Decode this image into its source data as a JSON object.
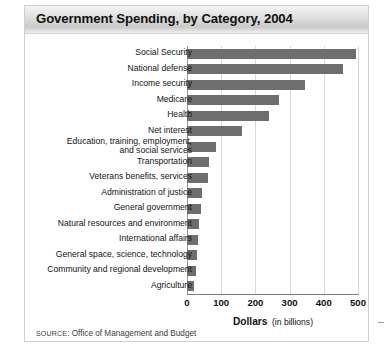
{
  "figure": {
    "title": "Government Spending, by Category, 2004",
    "source_prefix": "SOURCE",
    "source_rest": ": Office of Management and Budget",
    "axis_title_strong": "Dollars",
    "axis_title_sub": "(in billions)",
    "bar_color": "#6e6e6e",
    "grid_color": "#d9d9d9",
    "axis_color": "#7d7d7d",
    "title_band_color": "#dedede"
  },
  "chart_data": {
    "type": "bar",
    "orientation": "horizontal",
    "title": "Government Spending, by Category, 2004",
    "xlabel": "Dollars (in billions)",
    "ylabel": "",
    "xlim": [
      0,
      500
    ],
    "xticks": [
      0,
      100,
      200,
      300,
      400,
      500
    ],
    "grid": true,
    "legend": false,
    "source": "SOURCE: Office of Management and Budget",
    "categories": [
      "Social Security",
      "National defense",
      "Income security",
      "Medicare",
      "Health",
      "Net interest",
      "Education, training, employment,\nand social services",
      "Transportation",
      "Veterans benefits, services",
      "Administration of justice",
      "General government",
      "Natural resources and environment",
      "International affairs",
      "General space, science, technology",
      "Community and regional development",
      "Agriculture"
    ],
    "values": [
      495,
      455,
      345,
      270,
      240,
      160,
      85,
      65,
      60,
      45,
      40,
      35,
      32,
      28,
      25,
      20
    ]
  }
}
